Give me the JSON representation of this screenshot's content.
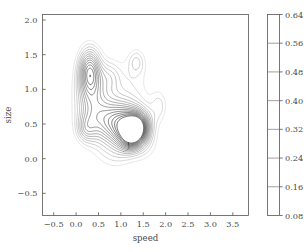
{
  "chart_data": {
    "type": "contour",
    "title": "",
    "xlabel": "speed",
    "ylabel": "size",
    "xlim": [
      -0.75,
      3.85
    ],
    "ylim": [
      -0.82,
      2.08
    ],
    "xticks": [
      "-0.5",
      "0.0",
      "0.5",
      "1.0",
      "1.5",
      "2.0",
      "2.5",
      "3.0",
      "3.5"
    ],
    "xtick_values": [
      -0.5,
      0.0,
      0.5,
      1.0,
      1.5,
      2.0,
      2.5,
      3.0,
      3.5
    ],
    "yticks": [
      "-0.5",
      "0.0",
      "0.5",
      "1.0",
      "1.5",
      "2.0"
    ],
    "ytick_values": [
      -0.5,
      0.0,
      0.5,
      1.0,
      1.5,
      2.0
    ],
    "grid": false,
    "legend": null,
    "colorbar": {
      "position": "right",
      "vmin": 0.08,
      "vmax": 0.64,
      "ticks": [
        "0.08",
        "0.16",
        "0.24",
        "0.32",
        "0.40",
        "0.48",
        "0.56",
        "0.64"
      ],
      "tick_values": [
        0.08,
        0.16,
        0.24,
        0.32,
        0.4,
        0.48,
        0.56,
        0.64
      ],
      "cmap": "Greys"
    },
    "contour_levels": [
      0.08,
      0.12,
      0.16,
      0.2,
      0.24,
      0.28,
      0.32,
      0.36,
      0.4,
      0.44,
      0.48,
      0.52,
      0.56,
      0.6,
      0.64
    ],
    "density_peaks": [
      {
        "x": 1.32,
        "y": 0.4,
        "value": 0.64,
        "label": "primary-mode"
      },
      {
        "x": 0.3,
        "y": 1.3,
        "value": 0.4,
        "label": "secondary-mode"
      },
      {
        "x": 0.95,
        "y": 0.55,
        "value": 0.34,
        "label": "ridge-shoulder"
      },
      {
        "x": 0.2,
        "y": 0.42,
        "value": 0.18,
        "label": "minor-lobe-left"
      },
      {
        "x": 1.35,
        "y": 1.4,
        "value": 0.13,
        "label": "minor-lobe-upper"
      },
      {
        "x": 1.85,
        "y": 0.75,
        "value": 0.12,
        "label": "minor-lobe-right"
      },
      {
        "x": 0.75,
        "y": 1.18,
        "value": 0.13,
        "label": "minor-lobe-mid"
      }
    ],
    "mixture_components": [
      {
        "x": 1.32,
        "y": 0.4,
        "sx": 0.2,
        "sy": 0.17,
        "rho": 0.25,
        "w": 0.64
      },
      {
        "x": 1.12,
        "y": 0.45,
        "sx": 0.26,
        "sy": 0.2,
        "rho": 0.1,
        "w": 0.3
      },
      {
        "x": 0.92,
        "y": 0.55,
        "sx": 0.33,
        "sy": 0.22,
        "rho": 0.05,
        "w": 0.26
      },
      {
        "x": 0.55,
        "y": 0.55,
        "sx": 0.33,
        "sy": 0.26,
        "rho": 0.0,
        "w": 0.19
      },
      {
        "x": 0.3,
        "y": 1.28,
        "sx": 0.17,
        "sy": 0.23,
        "rho": 0.0,
        "w": 0.38
      },
      {
        "x": 0.33,
        "y": 1.05,
        "sx": 0.24,
        "sy": 0.28,
        "rho": 0.0,
        "w": 0.16
      },
      {
        "x": 0.22,
        "y": 0.43,
        "sx": 0.15,
        "sy": 0.14,
        "rho": 0.0,
        "w": 0.17
      },
      {
        "x": 0.76,
        "y": 1.18,
        "sx": 0.17,
        "sy": 0.16,
        "rho": 0.0,
        "w": 0.13
      },
      {
        "x": 1.35,
        "y": 1.4,
        "sx": 0.13,
        "sy": 0.13,
        "rho": 0.0,
        "w": 0.13
      },
      {
        "x": 1.86,
        "y": 0.76,
        "sx": 0.13,
        "sy": 0.16,
        "rho": 0.0,
        "w": 0.12
      },
      {
        "x": 1.2,
        "y": 1.05,
        "sx": 0.38,
        "sy": 0.33,
        "rho": 0.0,
        "w": 0.1
      },
      {
        "x": 0.85,
        "y": 0.05,
        "sx": 0.3,
        "sy": 0.18,
        "rho": 0.0,
        "w": 0.09
      },
      {
        "x": 1.55,
        "y": 0.25,
        "sx": 0.22,
        "sy": 0.22,
        "rho": 0.0,
        "w": 0.11
      },
      {
        "x": 0.35,
        "y": 0.8,
        "sx": 0.28,
        "sy": 0.3,
        "rho": 0.0,
        "w": 0.12
      }
    ]
  },
  "axes": {
    "xlabel": "speed",
    "ylabel": "size"
  }
}
